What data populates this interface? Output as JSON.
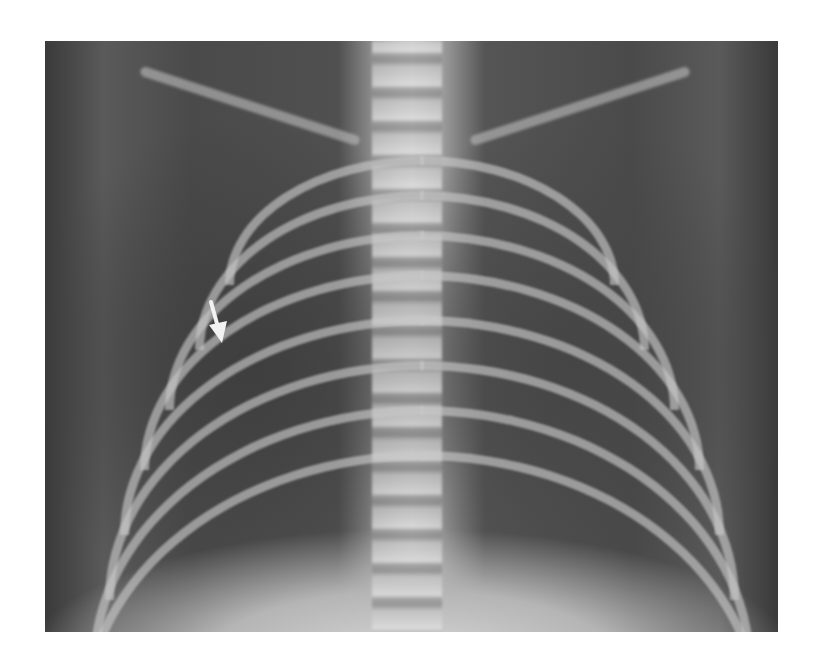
{
  "image": {
    "subject": "chest-xray",
    "view": "frontal",
    "annotation": {
      "type": "arrow",
      "color": "#f2f2f2",
      "direction": "down-right",
      "position_hint": "right hemithorax, mid-lung"
    }
  }
}
